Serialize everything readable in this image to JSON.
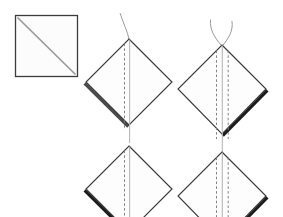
{
  "figure": {
    "title": "Fabric folding diagram",
    "canvas": {
      "width": 283,
      "height": 217,
      "background": "#ffffff"
    },
    "colors": {
      "outline": "#3a3a3a",
      "bold_edge_mid": "#4a4a4a",
      "bold_edge_dark": "#1c1c1c",
      "dashed_fold": "#7d7d7d",
      "solid_fold": "#b8b8b8",
      "thread": "#8e8e8e",
      "diagonal": "#9a9a9a",
      "panel_fill": "#fdfdfd"
    },
    "parts": [
      {
        "id": "square-with-diagonal",
        "name": "square-with-diagonal",
        "shape": "square",
        "x": 15,
        "y": 15,
        "width": 63,
        "height": 62,
        "diagonal": "top-left-to-bottom-right",
        "bold_edge": "none",
        "threads": 0,
        "dashed_fold_lines": 0,
        "solid_fold_lines": 0
      },
      {
        "id": "diamond-top-left",
        "name": "diamond-top-left",
        "shape": "diamond",
        "center_x": 129,
        "center_y": 82,
        "half_width": 43,
        "half_height": 43,
        "bold_edge": "lower-left",
        "bold_edge_color": "#4a4a4a",
        "threads": 1,
        "dashed_fold_lines": 1,
        "solid_fold_lines": 1,
        "clipped": false
      },
      {
        "id": "diamond-top-right",
        "name": "diamond-top-right",
        "shape": "diamond",
        "center_x": 222,
        "center_y": 89,
        "half_width": 44,
        "half_height": 45,
        "bold_edge": "lower-right",
        "bold_edge_color": "#1c1c1c",
        "threads": 2,
        "dashed_fold_lines": 2,
        "solid_fold_lines": 1,
        "clipped": false
      },
      {
        "id": "diamond-bottom-left",
        "name": "diamond-bottom-left",
        "shape": "diamond",
        "center_x": 129,
        "center_y": 189,
        "half_width": 43,
        "half_height": 43,
        "bold_edge": "lower-left",
        "bold_edge_color": "#1c1c1c",
        "threads": 0,
        "dashed_fold_lines": 1,
        "solid_fold_lines": 1,
        "clipped": true
      },
      {
        "id": "diamond-bottom-right",
        "name": "diamond-bottom-right",
        "shape": "diamond",
        "center_x": 222,
        "center_y": 196,
        "half_width": 44,
        "half_height": 45,
        "bold_edge": "lower-right",
        "bold_edge_color": "#1c1c1c",
        "threads": 0,
        "dashed_fold_lines": 2,
        "solid_fold_lines": 1,
        "clipped": true
      }
    ],
    "labels": []
  }
}
